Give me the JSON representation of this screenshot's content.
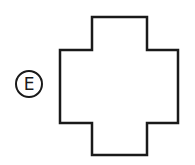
{
  "option": {
    "label": "E",
    "stroke_color": "#1a1a1a"
  },
  "shape": {
    "type": "cross-shaped polygon",
    "points": "92,17 147,17 147,50 178,50 178,123 147,123 147,155 92,155 92,123 60,123 60,50 92,50"
  }
}
